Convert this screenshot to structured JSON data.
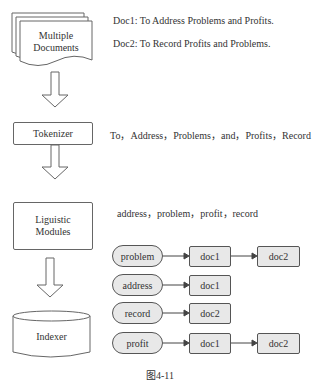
{
  "pipeline": {
    "documents_label_line1": "Multiple",
    "documents_label_line2": "Documents",
    "tokenizer_label": "Tokenizer",
    "linguistic_label_line1": "Liguistic",
    "linguistic_label_line2": "Modules",
    "indexer_label": "Indexer"
  },
  "annotations": {
    "doc1": "Doc1: To Address Problems and Profits.",
    "doc2": "Doc2: To Record Profits and Problems.",
    "tokens": "To，Address，Problems，and，Profits，Record",
    "terms": "address，problem，profit，record"
  },
  "index": [
    {
      "term": "problem",
      "postings": [
        "doc1",
        "doc2"
      ]
    },
    {
      "term": "address",
      "postings": [
        "doc1"
      ]
    },
    {
      "term": "record",
      "postings": [
        "doc2"
      ]
    },
    {
      "term": "profit",
      "postings": [
        "doc1",
        "doc2"
      ]
    }
  ],
  "caption": "图4-11"
}
